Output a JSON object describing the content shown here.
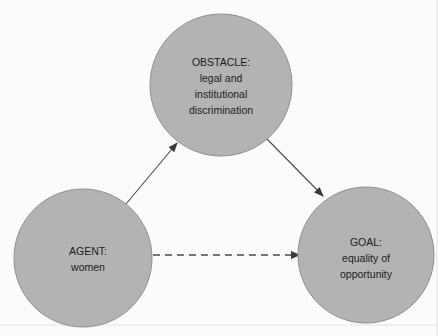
{
  "diagram": {
    "background_color": "#fbfbfb",
    "node_fill_color": "#b3b3b3",
    "node_stroke_color": "#8f8f8f",
    "text_color": "#1c1c1c",
    "edge_color": "#4a4a4a",
    "nodes": [
      {
        "id": "obstacle",
        "cx": 221,
        "cy": 85,
        "r": 71,
        "lines": [
          "OBSTACLE:",
          "legal and",
          "institutional",
          "discrimination"
        ]
      },
      {
        "id": "agent",
        "cx": 83,
        "cy": 258,
        "r": 69,
        "lines": [
          "AGENT:",
          "women"
        ]
      },
      {
        "id": "goal",
        "cx": 366,
        "cy": 255,
        "r": 68,
        "lines": [
          "GOAL:",
          "equality of",
          "opportunity"
        ]
      }
    ],
    "edges": [
      {
        "id": "agent-to-obstacle",
        "from": "agent",
        "to": "obstacle",
        "style": "solid",
        "x1": 126,
        "y1": 204,
        "x2": 177,
        "y2": 143
      },
      {
        "id": "obstacle-to-goal",
        "from": "obstacle",
        "to": "goal",
        "style": "solid",
        "x1": 267,
        "y1": 139,
        "x2": 323,
        "y2": 196
      },
      {
        "id": "agent-to-goal",
        "from": "agent",
        "to": "goal",
        "style": "dashed",
        "x1": 153,
        "y1": 255,
        "x2": 299,
        "y2": 255
      }
    ]
  }
}
